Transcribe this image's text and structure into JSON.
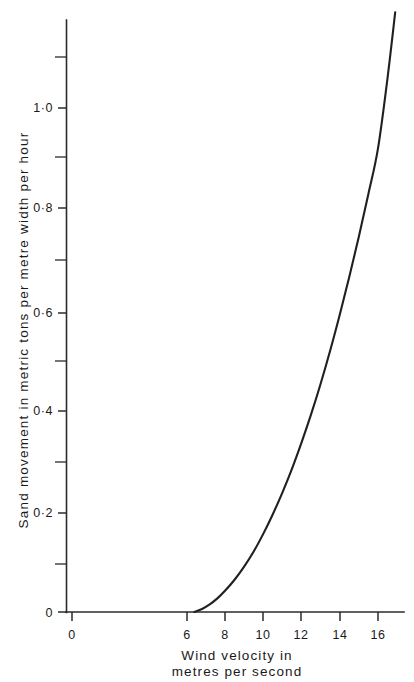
{
  "chart_data": {
    "type": "line",
    "title": "",
    "xlabel": "Wind velocity in metres per second",
    "xlabel_line1": "Wind  velocity  in",
    "xlabel_line2": "metres  per  second",
    "ylabel": "Sand movement in metric tons per metre width per hour",
    "xlim": [
      0,
      17.4
    ],
    "ylim": [
      0,
      1.19
    ],
    "grid": false,
    "legend": null,
    "x_ticks": [
      0,
      6,
      8,
      10,
      12,
      14,
      16
    ],
    "x_tick_labels": [
      "0",
      "6",
      "8",
      "10",
      "12",
      "14",
      "16"
    ],
    "x_minor_ticks": [
      7,
      9,
      11,
      13,
      15,
      17
    ],
    "y_ticks": [
      0,
      0.2,
      0.4,
      0.6,
      0.8,
      1.0
    ],
    "y_tick_labels": [
      "0",
      "0·2",
      "0·4",
      "0·6",
      "0·8",
      "1·0"
    ],
    "y_minor_ticks": [
      0.1,
      0.3,
      0.5,
      0.7,
      0.9,
      1.1
    ],
    "threshold_velocity": 6.4,
    "series": [
      {
        "name": "sand movement",
        "color": "#202020",
        "x": [
          6.4,
          6.8,
          7.2,
          7.6,
          8.0,
          8.5,
          9.0,
          9.5,
          10.0,
          10.5,
          11.0,
          11.5,
          12.0,
          12.5,
          13.0,
          13.5,
          14.0,
          14.5,
          15.0,
          15.5,
          16.0,
          16.5,
          16.9
        ],
        "y": [
          0.0,
          0.006,
          0.015,
          0.027,
          0.042,
          0.064,
          0.09,
          0.12,
          0.155,
          0.194,
          0.237,
          0.284,
          0.336,
          0.392,
          0.453,
          0.519,
          0.59,
          0.665,
          0.745,
          0.83,
          0.92,
          1.06,
          1.19
        ]
      }
    ]
  },
  "figure": {
    "background_color": "#ffffff",
    "axis_color": "#2b2b2b",
    "curve_color": "#202020"
  }
}
